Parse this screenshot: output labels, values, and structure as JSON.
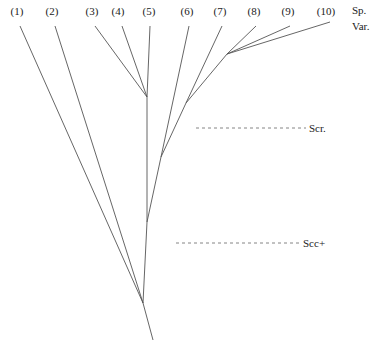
{
  "diagram": {
    "type": "phylogenetic-tree",
    "line_color": "#555555",
    "label_color": "#222222",
    "header": {
      "line1": "Sp.",
      "line2": "Var."
    },
    "leaves": [
      {
        "id": "1",
        "label": "(1)",
        "x": 17,
        "y": 15
      },
      {
        "id": "2",
        "label": "(2)",
        "x": 52,
        "y": 15
      },
      {
        "id": "3",
        "label": "(3)",
        "x": 92,
        "y": 15
      },
      {
        "id": "4",
        "label": "(4)",
        "x": 118,
        "y": 15
      },
      {
        "id": "5",
        "label": "(5)",
        "x": 149,
        "y": 15
      },
      {
        "id": "6",
        "label": "(6)",
        "x": 187,
        "y": 15
      },
      {
        "id": "7",
        "label": "(7)",
        "x": 220,
        "y": 15
      },
      {
        "id": "8",
        "label": "(8)",
        "x": 254,
        "y": 15
      },
      {
        "id": "9",
        "label": "(9)",
        "x": 288,
        "y": 15
      },
      {
        "id": "10",
        "label": "(10)",
        "x": 326,
        "y": 15
      }
    ],
    "levels": [
      {
        "id": "scr",
        "label": "Scr.",
        "y": 128,
        "x1": 196,
        "x2": 306
      },
      {
        "id": "scc",
        "label": "Scc+",
        "y": 243,
        "x1": 176,
        "x2": 300
      }
    ],
    "edges": [
      {
        "from": [
          153,
          340
        ],
        "to": [
          143,
          303
        ]
      },
      {
        "from": [
          143,
          303
        ],
        "to": [
          20,
          26
        ]
      },
      {
        "from": [
          143,
          303
        ],
        "to": [
          55,
          26
        ]
      },
      {
        "from": [
          143,
          303
        ],
        "to": [
          147,
          222
        ]
      },
      {
        "from": [
          147,
          222
        ],
        "to": [
          147,
          97
        ]
      },
      {
        "from": [
          147,
          97
        ],
        "to": [
          95,
          26
        ]
      },
      {
        "from": [
          147,
          97
        ],
        "to": [
          122,
          26
        ]
      },
      {
        "from": [
          147,
          97
        ],
        "to": [
          150,
          26
        ]
      },
      {
        "from": [
          147,
          222
        ],
        "to": [
          161,
          157
        ]
      },
      {
        "from": [
          161,
          157
        ],
        "to": [
          189,
          26
        ]
      },
      {
        "from": [
          161,
          157
        ],
        "to": [
          186,
          103
        ]
      },
      {
        "from": [
          186,
          103
        ],
        "to": [
          222,
          26
        ]
      },
      {
        "from": [
          186,
          103
        ],
        "to": [
          227,
          54
        ]
      },
      {
        "from": [
          227,
          54
        ],
        "to": [
          256,
          26
        ]
      },
      {
        "from": [
          227,
          54
        ],
        "to": [
          290,
          26
        ]
      },
      {
        "from": [
          227,
          54
        ],
        "to": [
          330,
          22
        ]
      }
    ]
  }
}
